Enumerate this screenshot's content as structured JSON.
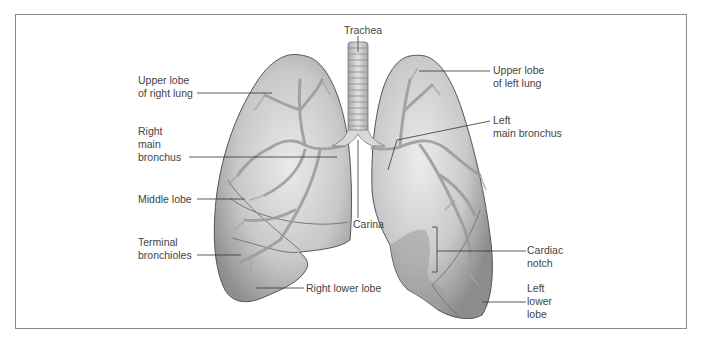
{
  "diagram": {
    "labels": {
      "trachea": "Trachea",
      "upper_lobe_right": "Upper lobe\nof right lung",
      "right_main_bronchus": "Right\nmain\nbronchus",
      "middle_lobe": "Middle lobe",
      "terminal_bronchioles": "Terminal\nbronchioles",
      "right_lower_lobe": "Right lower lobe",
      "carina": "Carina",
      "upper_lobe_left": "Upper lobe\nof left lung",
      "left_main_bronchus": "Left\nmain bronchus",
      "cardiac_notch": "Cardiac\nnotch",
      "left_lower_lobe": "Left\nlower\nlobe"
    },
    "colors": {
      "frame": "#8a8a8a",
      "leader_line": "#333333",
      "lung_fill": "#bdbdbd",
      "lung_edge": "#555555",
      "airway": "#9a9a9a",
      "text": "#444444"
    }
  }
}
